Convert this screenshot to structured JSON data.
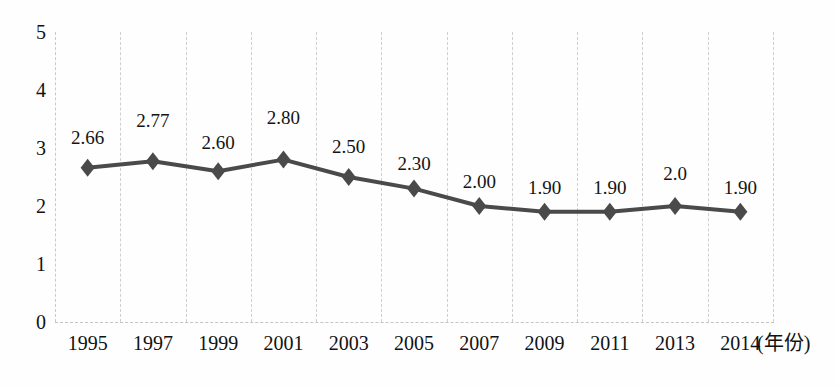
{
  "chart_data": {
    "type": "line",
    "title": "",
    "xlabel": "(年份)",
    "ylabel": "",
    "ylim": [
      0,
      5
    ],
    "ytick_labels": [
      "5",
      "4",
      "3",
      "2",
      "1",
      "0"
    ],
    "ytick_values": [
      5,
      4,
      3,
      2,
      1,
      0
    ],
    "grid": "vertical-dashed",
    "legend": "none",
    "categories": [
      "1995",
      "1997",
      "1999",
      "2001",
      "2003",
      "2005",
      "2007",
      "2009",
      "2011",
      "2013",
      "2014"
    ],
    "values": [
      2.66,
      2.77,
      2.6,
      2.8,
      2.5,
      2.3,
      2.0,
      1.9,
      1.9,
      2.0,
      1.9
    ],
    "point_labels": [
      "2.66",
      "2.77",
      "2.60",
      "2.80",
      "2.50",
      "2.30",
      "2.00",
      "1.90",
      "1.90",
      "2.0",
      "1.90"
    ],
    "marker": "diamond",
    "series_color": "#4a4a4a",
    "grid_color": "#cfcfcf"
  },
  "axes": {
    "x_axis_title": "(年份)"
  },
  "caption": {
    "text": ""
  }
}
